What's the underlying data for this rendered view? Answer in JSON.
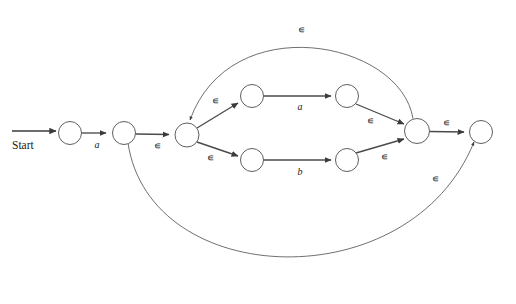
{
  "diagram": {
    "type": "finite-automaton",
    "background_color": "#ffffff",
    "stroke_color": "#4d4d4d",
    "text_color": "#1a1a1a",
    "start_label": "Start",
    "epsilon_symbol": "∊",
    "states": [
      {
        "id": "q0",
        "cx": 70,
        "cy": 133,
        "r": 11.5,
        "accepting": false
      },
      {
        "id": "q1",
        "cx": 124,
        "cy": 133,
        "r": 11.5,
        "accepting": false
      },
      {
        "id": "q2",
        "cx": 187,
        "cy": 135,
        "r": 12.0,
        "accepting": false
      },
      {
        "id": "q3",
        "cx": 252,
        "cy": 96,
        "r": 11.5,
        "accepting": false
      },
      {
        "id": "q4",
        "cx": 347,
        "cy": 96,
        "r": 11.5,
        "accepting": false
      },
      {
        "id": "q5",
        "cx": 252,
        "cy": 160,
        "r": 11.5,
        "accepting": false
      },
      {
        "id": "q6",
        "cx": 347,
        "cy": 160,
        "r": 11.5,
        "accepting": false
      },
      {
        "id": "q7",
        "cx": 417,
        "cy": 131,
        "r": 12.5,
        "accepting": false
      },
      {
        "id": "q8",
        "cx": 481,
        "cy": 132,
        "r": 11.5,
        "accepting": false
      }
    ],
    "transitions": [
      {
        "from": "start",
        "to": "q0",
        "label": "",
        "shape": "straight"
      },
      {
        "from": "q0",
        "to": "q1",
        "label": "a",
        "shape": "straight"
      },
      {
        "from": "q1",
        "to": "q2",
        "label": "∊",
        "shape": "straight"
      },
      {
        "from": "q2",
        "to": "q3",
        "label": "∊",
        "shape": "straight"
      },
      {
        "from": "q3",
        "to": "q4",
        "label": "a",
        "shape": "straight"
      },
      {
        "from": "q2",
        "to": "q5",
        "label": "∊",
        "shape": "straight"
      },
      {
        "from": "q5",
        "to": "q6",
        "label": "b",
        "shape": "straight"
      },
      {
        "from": "q4",
        "to": "q7",
        "label": "∊",
        "shape": "straight"
      },
      {
        "from": "q6",
        "to": "q7",
        "label": "∊",
        "shape": "straight"
      },
      {
        "from": "q7",
        "to": "q8",
        "label": "∊",
        "shape": "straight"
      },
      {
        "from": "q7",
        "to": "q2",
        "label": "∊",
        "shape": "arc-top"
      },
      {
        "from": "q1",
        "to": "q8",
        "label": "∊",
        "shape": "arc-bottom"
      }
    ],
    "edge_labels": {
      "start_to_q0": "Start",
      "q0_q1": "a",
      "q1_q2": "∊",
      "q2_q3": "∊",
      "q3_q4": "a",
      "q2_q5": "∊",
      "q5_q6": "b",
      "q4_q7": "∊",
      "q6_q7": "∊",
      "q7_q8": "∊",
      "loop_top": "∊",
      "bypass_bottom": "∊"
    }
  }
}
